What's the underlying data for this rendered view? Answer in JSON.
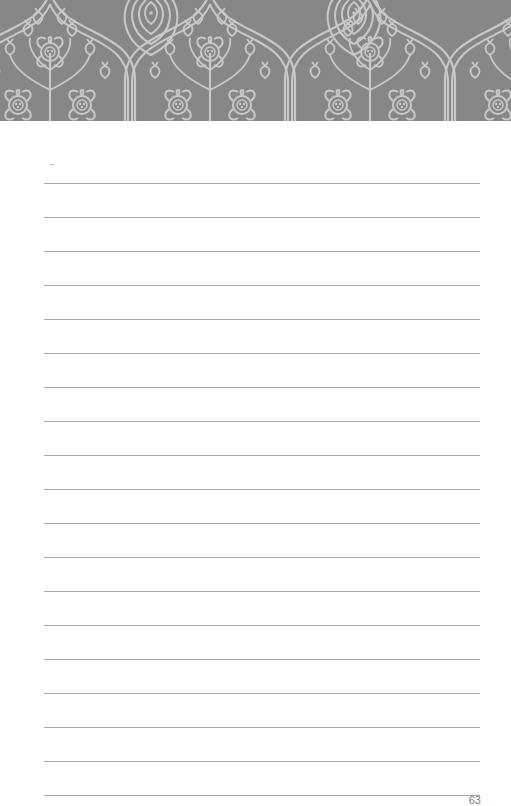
{
  "page": {
    "type": "lined-notebook-page",
    "header": {
      "pattern": "ornate-floral-damask",
      "background_color": "#878787",
      "line_color": "#c9c9c9"
    },
    "rules": {
      "count": 19,
      "first_y": 183,
      "spacing": 34,
      "left": 44,
      "right": 480,
      "color": "#a9a9a9"
    },
    "page_number": "63"
  }
}
